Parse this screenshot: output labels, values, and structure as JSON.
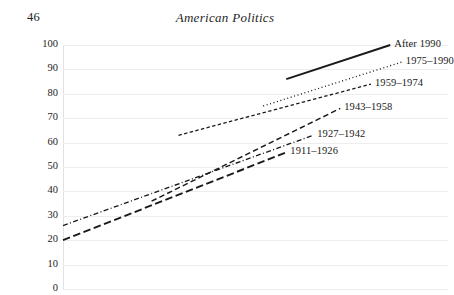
{
  "page": {
    "folio": "46",
    "running_head": "American Politics"
  },
  "chart_data": {
    "type": "line",
    "title": "American Politics",
    "xlabel": "",
    "ylabel": "",
    "ylim": [
      0,
      100
    ],
    "xlim": [
      0,
      100
    ],
    "grid": true,
    "grid_axis": "y",
    "legend_position": "inline-right",
    "y_ticks": [
      "100",
      "90",
      "80",
      "70",
      "60",
      "50",
      "40",
      "30",
      "20",
      "10",
      "0"
    ],
    "y_tick_values": [
      100,
      90,
      80,
      70,
      60,
      50,
      40,
      30,
      20,
      10,
      0
    ],
    "x_tick_labels": [],
    "note": "X axis tick labels are cropped off the bottom of the page.",
    "series": [
      {
        "name": "After 1990",
        "style": "solid",
        "label": "After 1990",
        "x": [
          58,
          85
        ],
        "y": [
          86,
          100
        ]
      },
      {
        "name": "1975-1990",
        "style": "dotted",
        "label": "1975–1990",
        "x": [
          52,
          88
        ],
        "y": [
          75,
          93
        ]
      },
      {
        "name": "1959-1974",
        "style": "dashed-dense",
        "label": "1959–1974",
        "x": [
          30,
          80
        ],
        "y": [
          63,
          84
        ]
      },
      {
        "name": "1943-1958",
        "style": "dashed",
        "label": "1943–1958",
        "x": [
          23,
          72
        ],
        "y": [
          36,
          74
        ]
      },
      {
        "name": "1927-1942",
        "style": "dash-dot",
        "label": "1927–1942",
        "x": [
          0,
          65
        ],
        "y": [
          26,
          63
        ]
      },
      {
        "name": "1911-1926",
        "style": "long-dash",
        "label": "1911–1926",
        "x": [
          0,
          58
        ],
        "y": [
          20,
          56
        ]
      }
    ]
  },
  "colors": {
    "ink": "#1a1a1a",
    "grid": "#ededed",
    "axis": "#e2e2e2",
    "background": "#ffffff"
  }
}
